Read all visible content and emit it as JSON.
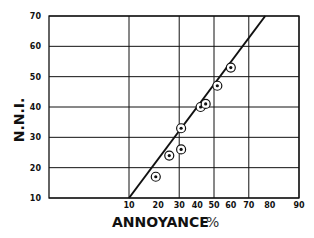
{
  "chart_data": {
    "type": "scatter",
    "title": "",
    "xlabel": "ANNOYANCE",
    "xlabel_unit": "%",
    "ylabel": "N.N.I.",
    "x_scale": "probability",
    "xlim": [
      10,
      90
    ],
    "ylim": [
      10,
      70
    ],
    "x_ticks": [
      "10",
      "20",
      "30",
      "40",
      "50",
      "60",
      "70",
      "80",
      "90"
    ],
    "y_ticks": [
      "10",
      "20",
      "30",
      "40",
      "50",
      "60",
      "70"
    ],
    "grid": {
      "x_lines_at": [
        10,
        30,
        50,
        70,
        90
      ],
      "y_lines_at": [
        10,
        20,
        30,
        40,
        50,
        60,
        70
      ]
    },
    "legend": null,
    "series": [
      {
        "name": "observations",
        "marker": "circled-dot",
        "points": [
          {
            "x": 19,
            "y": 17
          },
          {
            "x": 25,
            "y": 24
          },
          {
            "x": 31,
            "y": 26
          },
          {
            "x": 31,
            "y": 33
          },
          {
            "x": 42,
            "y": 40
          },
          {
            "x": 45,
            "y": 41
          },
          {
            "x": 52,
            "y": 47
          },
          {
            "x": 60,
            "y": 53
          }
        ]
      },
      {
        "name": "fit-line",
        "type": "line",
        "points": [
          {
            "x": 10,
            "y": 10
          },
          {
            "x": 78,
            "y": 70
          }
        ]
      }
    ]
  },
  "colors": {
    "ink": "#111111",
    "background": "#ffffff"
  }
}
